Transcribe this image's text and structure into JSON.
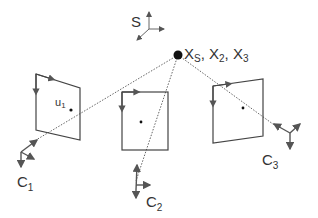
{
  "diagram": {
    "scene_point": {
      "label_parts": [
        "X",
        "S",
        ", X",
        "2",
        ", X",
        "3"
      ]
    },
    "scene_frame": {
      "label": "S"
    },
    "cameras": [
      {
        "id": "C1",
        "label": "C",
        "label_sub": "1",
        "image_point_label": "u",
        "image_point_sub": "1"
      },
      {
        "id": "C2",
        "label": "C",
        "label_sub": "2"
      },
      {
        "id": "C3",
        "label": "C",
        "label_sub": "3"
      }
    ],
    "colors": {
      "stroke": "#555555",
      "point": "#111111",
      "text": "#333333"
    }
  }
}
